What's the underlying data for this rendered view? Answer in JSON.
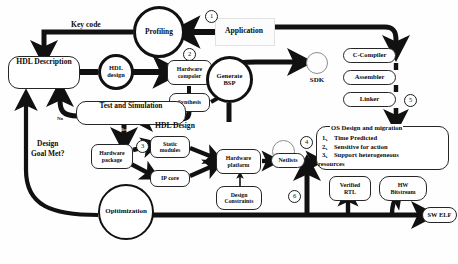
{
  "diagram": {
    "type": "flowchart",
    "nodes": {
      "application": "Application",
      "profiling": "Profiling",
      "hdl_description": "HDL Description",
      "hdl_design_circle_line1": "HDL",
      "hdl_design_circle_line2": "design",
      "hardware_compiler_line1": "Hardware",
      "hardware_compiler_line2": "compoler",
      "synthesis": "Synthesis",
      "test_and_simulation": "Test and Simulation",
      "generate_bsp_line1": "Generate",
      "generate_bsp_line2": "BSP",
      "sdk": "SDK",
      "c_compiler": "C-Compiler",
      "assembler": "Assembler",
      "linker": "Linker",
      "hardware_package_line1": "Hardware",
      "hardware_package_line2": "package",
      "static_modules_line1": "Static",
      "static_modules_line2": "modules",
      "ip_core": "IP core",
      "hardware_platform_line1": "Hardware",
      "hardware_platform_line2": "platform",
      "design_constraints_line1": "Design",
      "design_constraints_line2": "Constraints",
      "netlists": "Netlists",
      "optimization": "Opitimization",
      "verified_rtl_line1": "Verified",
      "verified_rtl_line2": "RTL",
      "hw_bitstream_line1": "HW",
      "hw_bitstream_line2": "Bitstream",
      "sw_elf": "SW ELF",
      "os_design_title": "OS Design and migration",
      "os_design_item1": "1、 Time Predicted",
      "os_design_item2": "2、 Sensitive for action",
      "os_design_item3": "3、 Support heterogeneous",
      "os_design_item4": "resources"
    },
    "edge_labels": {
      "key_code": "Key code",
      "hdl_design_arrow": "HDL Design",
      "design_goal_met_line1": "Design",
      "design_goal_met_line2": "Goal Met?",
      "no": "No",
      "yes": "Yes"
    },
    "badges": {
      "b1": "1",
      "b2": "2",
      "b3": "3",
      "b4": "4",
      "b5": "5",
      "b6": "6"
    },
    "colors": {
      "ink": "#0b0b0b",
      "edge": "#111111",
      "node_border": "#262626",
      "faint": "#cfcfcf",
      "background": "#ffffff"
    }
  }
}
